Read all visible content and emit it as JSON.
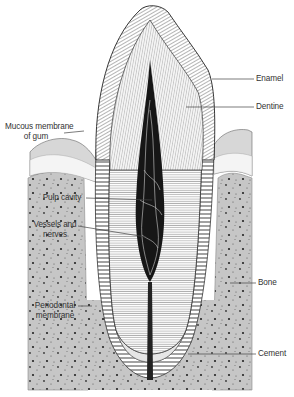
{
  "diagram": {
    "labels": {
      "enamel": "Enamel",
      "dentine": "Dentine",
      "mucous_membrane_line1": "Mucous membrane",
      "mucous_membrane_line2": "of gum",
      "pulp_cavity": "Pulp cavity",
      "vessels_line1": "Vessels and",
      "vessels_line2": "nerves",
      "bone": "Bone",
      "periodontal_line1": "Periodontal",
      "periodontal_line2": "membrane",
      "cement": "Cement"
    },
    "colors": {
      "background": "#ffffff",
      "bone": "#c8c8c8",
      "gum": "#d8d8d8",
      "pulp": "#1a1a1a",
      "line": "#333333",
      "label_text": "#333333"
    }
  }
}
